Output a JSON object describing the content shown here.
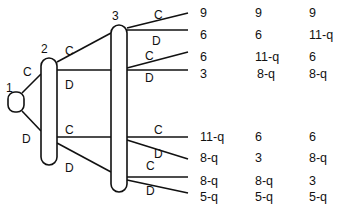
{
  "diagram": {
    "type": "game-tree",
    "nodes": [
      {
        "id": "1",
        "label": "1"
      },
      {
        "id": "2",
        "label": "2"
      },
      {
        "id": "3",
        "label": "3"
      }
    ],
    "edges": {
      "n1_top": "C",
      "n1_bottom": "D",
      "n2_top_c": "C",
      "n2_top_d": "D",
      "n2_bottom_c": "C",
      "n2_bottom_d": "D",
      "n3_e1": "C",
      "n3_e2": "D",
      "n3_e3": "C",
      "n3_e4": "D",
      "n3_e5": "C",
      "n3_e6": "D",
      "n3_e7": "C",
      "n3_e8": "D"
    },
    "payoffs": [
      [
        "9",
        "9",
        "9"
      ],
      [
        "6",
        "6",
        "11-q"
      ],
      [
        "6",
        "11-q",
        "6"
      ],
      [
        "3",
        "8-q",
        "8-q"
      ],
      [
        "11-q",
        "6",
        "6"
      ],
      [
        "8-q",
        "3",
        "8-q"
      ],
      [
        "8-q",
        "8-q",
        "3"
      ],
      [
        "5-q",
        "5-q",
        "5-q"
      ]
    ]
  }
}
